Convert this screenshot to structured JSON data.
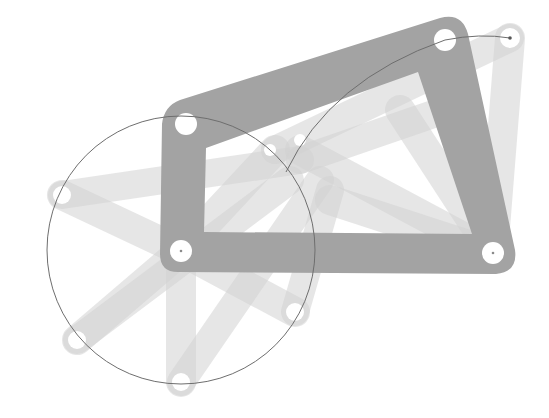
{
  "figure": {
    "colors": {
      "background": "#ffffff",
      "frame": "#a3a3a3",
      "ghost_link": "#d2d2d2",
      "joint_hole": "#ffffff",
      "trace_line": "#6e6e6e"
    },
    "frame_corners": [
      {
        "name": "top-left-joint",
        "x": 186,
        "y": 124
      },
      {
        "name": "top-right-joint",
        "x": 445,
        "y": 40
      },
      {
        "name": "bottom-right-pivot",
        "x": 493,
        "y": 253
      },
      {
        "name": "bottom-left-pivot",
        "x": 181,
        "y": 251
      }
    ],
    "crank_circle": {
      "cx": 181,
      "cy": 250,
      "r": 134
    },
    "crank_ghost_endpoints": [
      {
        "x": 62,
        "y": 195
      },
      {
        "x": 77,
        "y": 340
      },
      {
        "x": 181,
        "y": 382
      },
      {
        "x": 295,
        "y": 312
      },
      {
        "x": 270,
        "y": 150
      }
    ],
    "rocker_ghost_endpoints": [
      {
        "x": 510,
        "y": 38
      },
      {
        "x": 300,
        "y": 150
      },
      {
        "x": 330,
        "y": 200
      }
    ],
    "coupler_trace": {
      "start": {
        "x": 286,
        "y": 172
      },
      "end": {
        "x": 510,
        "y": 38
      }
    }
  }
}
